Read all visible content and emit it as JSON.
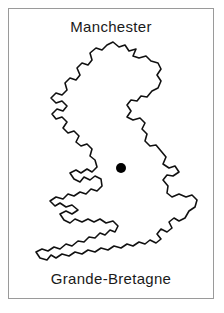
{
  "card": {
    "title": "Manchester",
    "caption": "Grande-Bretagne",
    "border_color": "#9a9a9a",
    "background_color": "#ffffff"
  },
  "map": {
    "name": "great-britain-outline",
    "outline_color": "#111111",
    "fill_color": "#ffffff",
    "marker": {
      "label": "Manchester",
      "color": "#000000",
      "x": 112,
      "y": 129,
      "radius": 5
    }
  }
}
